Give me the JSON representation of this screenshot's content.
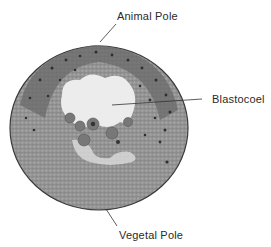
{
  "figure": {
    "labels": {
      "animal_pole": "Animal Pole",
      "blastocoel": "Blastocoel",
      "vegetal_pole": "Vegetal Pole"
    },
    "colors": {
      "background": "#ffffff",
      "embryo_fill": "#9a9a9a",
      "animal_cells": "#6e6e6e",
      "nuclei": "#2e2e2e",
      "cavity": "#e8e8e8",
      "leader_line": "#333333",
      "text": "#2a2a2a"
    }
  }
}
